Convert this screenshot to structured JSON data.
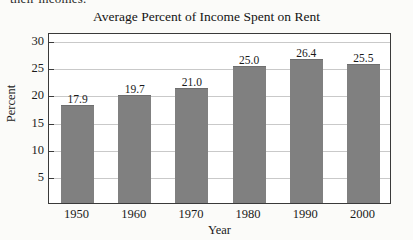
{
  "page": {
    "cropped_text_above_chart": "their incomes."
  },
  "chart_data": {
    "type": "bar",
    "title": "Average Percent of Income Spent on Rent",
    "xlabel": "Year",
    "ylabel": "Percent",
    "categories": [
      "1950",
      "1960",
      "1970",
      "1980",
      "1990",
      "2000"
    ],
    "values": [
      17.9,
      19.7,
      21.0,
      25.0,
      26.4,
      25.5
    ],
    "value_labels": [
      "17.9",
      "19.7",
      "21.0",
      "25.0",
      "26.4",
      "25.5"
    ],
    "yticks": [
      5,
      10,
      15,
      20,
      25,
      30
    ],
    "ytick_labels": [
      "5",
      "10",
      "15",
      "20",
      "25",
      "30"
    ],
    "ylim": [
      0,
      31.5
    ],
    "grid": true,
    "legend": false,
    "bar_color": "#808080",
    "plot_border_color": "#3a3a3a",
    "gridline_color": "#c9c9c9",
    "background_color": "#fbfbf9"
  }
}
